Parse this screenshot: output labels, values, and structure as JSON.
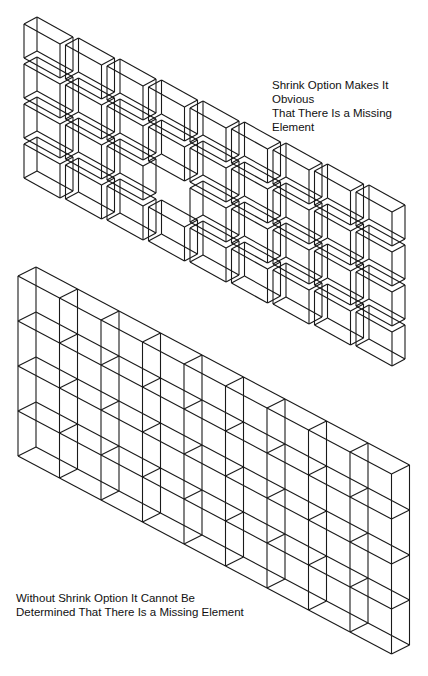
{
  "labels": {
    "shrink": [
      "Shrink Option Makes It Obvious",
      "That There Is a Missing Element"
    ],
    "no_shrink": [
      "Without Shrink Option It Cannot Be",
      "Determined That There Is a Missing Element"
    ]
  },
  "caption": "",
  "colors": {
    "line": "#1a1a1a",
    "background": "#ffffff"
  },
  "top_grid": {
    "description": "Shrunken isometric element boxes, 9 columns x 4 rows, one element missing",
    "columns": 9,
    "rows": 4,
    "missing": [
      [
        3,
        2
      ]
    ],
    "origin": [
      24,
      24
    ],
    "col_step": [
      41.5,
      21
    ],
    "row_step": [
      0,
      40
    ],
    "box_size": {
      "wx": 36,
      "wy": 20,
      "dx": 13,
      "dy": -7,
      "h": 34
    }
  },
  "bottom_grid": {
    "description": "Non-shrunk isometric element wall, 9 columns x 4 rows",
    "columns": 9,
    "rows": 4,
    "origin": [
      18,
      276
    ],
    "col_step": [
      41.5,
      22
    ],
    "row_step": [
      0,
      45
    ],
    "depth": [
      18,
      -9
    ]
  }
}
